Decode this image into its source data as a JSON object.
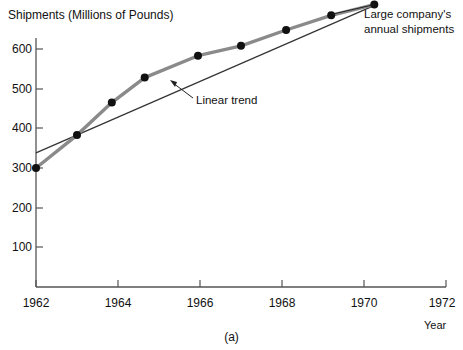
{
  "chart_data": {
    "type": "line",
    "title": "Shipments (Millions of Pounds)",
    "xlabel": "Year",
    "ylabel": "Shipments (Millions of Pounds)",
    "xlim": [
      1962,
      1972
    ],
    "ylim": [
      0,
      600
    ],
    "grid": false,
    "legend_position": "none",
    "xticks": [
      "1962",
      "1964",
      "1966",
      "1968",
      "1970",
      "1972"
    ],
    "xtick_values": [
      1962,
      1964,
      1966,
      1968,
      1970,
      1972
    ],
    "yticks": [
      "100",
      "200",
      "300",
      "400",
      "500",
      "600"
    ],
    "ytick_values": [
      100,
      200,
      300,
      400,
      500,
      600
    ],
    "caption": "(a)",
    "series": [
      {
        "name": "Large company's annual shipments",
        "style": "thick-gray-with-markers",
        "color": "#8a8a8a",
        "marker_color": "#111111",
        "x": [
          1962.0,
          1963.0,
          1963.85,
          1964.65,
          1965.95,
          1967.0,
          1968.1,
          1969.2,
          1970.25
        ],
        "y": [
          300,
          383,
          465,
          528,
          583,
          608,
          648,
          685,
          712
        ]
      },
      {
        "name": "Linear trend",
        "style": "thin-black-line",
        "color": "#333333",
        "x": [
          1962.0,
          1970.3
        ],
        "y": [
          338,
          712
        ]
      }
    ],
    "annotations": [
      {
        "name": "linear-trend",
        "text": "Linear trend",
        "text_x": 196,
        "text_y": 100,
        "leader_from_x": 193,
        "leader_from_y": 98,
        "leader_to_x": 171,
        "leader_to_y": 81
      },
      {
        "name": "large-company-shipments",
        "line1": "Large company's",
        "line2": "annual shipments",
        "text_x": 364,
        "text_y": 12
      }
    ]
  }
}
